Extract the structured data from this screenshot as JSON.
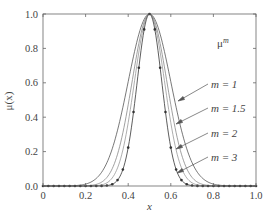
{
  "chart_data": {
    "type": "line",
    "title": "",
    "xlabel": "x",
    "ylabel": "μ(x)",
    "xlim": [
      0,
      1
    ],
    "ylim": [
      0,
      1
    ],
    "xticks": [
      "0",
      "0.2",
      "0.4",
      "0.6",
      "0.8",
      "1.0"
    ],
    "yticks": [
      "0.0",
      "0.2",
      "0.4",
      "0.6",
      "0.8",
      "1.0"
    ],
    "grid": false,
    "legend_title": "μ^m",
    "base_function": {
      "shape": "gaussian",
      "center": 0.5,
      "sigma": 0.1
    },
    "series": [
      {
        "name": "m = 1",
        "m": 1,
        "style": "solid",
        "color": "#555555",
        "x": [
          0.0,
          0.1,
          0.2,
          0.25,
          0.3,
          0.35,
          0.4,
          0.45,
          0.5,
          0.55,
          0.6,
          0.65,
          0.7,
          0.75,
          0.8,
          0.9,
          1.0
        ],
        "values": [
          0.0,
          0.0,
          0.01,
          0.04,
          0.14,
          0.32,
          0.61,
          0.88,
          1.0,
          0.88,
          0.61,
          0.32,
          0.14,
          0.04,
          0.01,
          0.0,
          0.0
        ]
      },
      {
        "name": "m = 1.5",
        "m": 1.5,
        "style": "solid",
        "color": "#888888",
        "x": [
          0.0,
          0.1,
          0.2,
          0.25,
          0.3,
          0.35,
          0.4,
          0.45,
          0.5,
          0.55,
          0.6,
          0.65,
          0.7,
          0.75,
          0.8,
          0.9,
          1.0
        ],
        "values": [
          0.0,
          0.0,
          0.0,
          0.01,
          0.05,
          0.18,
          0.47,
          0.83,
          1.0,
          0.83,
          0.47,
          0.18,
          0.05,
          0.01,
          0.0,
          0.0,
          0.0
        ]
      },
      {
        "name": "m = 2",
        "m": 2,
        "style": "solid",
        "color": "#999999",
        "x": [
          0.0,
          0.1,
          0.2,
          0.25,
          0.3,
          0.35,
          0.4,
          0.45,
          0.5,
          0.55,
          0.6,
          0.65,
          0.7,
          0.75,
          0.8,
          0.9,
          1.0
        ],
        "values": [
          0.0,
          0.0,
          0.0,
          0.0,
          0.02,
          0.11,
          0.37,
          0.78,
          1.0,
          0.78,
          0.37,
          0.11,
          0.02,
          0.0,
          0.0,
          0.0,
          0.0
        ]
      },
      {
        "name": "m = 3",
        "m": 3,
        "style": "solid-with-dot-markers",
        "color": "#333333",
        "x": [
          0.0,
          0.1,
          0.2,
          0.25,
          0.3,
          0.35,
          0.4,
          0.45,
          0.5,
          0.55,
          0.6,
          0.65,
          0.7,
          0.75,
          0.8,
          0.9,
          1.0
        ],
        "values": [
          0.0,
          0.0,
          0.0,
          0.0,
          0.0,
          0.03,
          0.22,
          0.69,
          1.0,
          0.69,
          0.22,
          0.03,
          0.0,
          0.0,
          0.0,
          0.0,
          0.0
        ]
      }
    ],
    "annotations": [
      {
        "text": "μ^m",
        "x": 0.8,
        "y": 0.86
      },
      {
        "text": "m = 1",
        "x": 0.82,
        "y": 0.62,
        "arrow_to": [
          0.645,
          0.39
        ]
      },
      {
        "text": "m = 1.5",
        "x": 0.82,
        "y": 0.48,
        "arrow_to": [
          0.635,
          0.25
        ]
      },
      {
        "text": "m = 2",
        "x": 0.82,
        "y": 0.34,
        "arrow_to": [
          0.64,
          0.16
        ]
      },
      {
        "text": "m = 3",
        "x": 0.82,
        "y": 0.21,
        "arrow_to": [
          0.62,
          0.08
        ]
      }
    ]
  },
  "labels": {
    "xlabel": "x",
    "ylabel": "μ(x)",
    "legend_title_base": "μ",
    "legend_title_sup": "m",
    "xticks": [
      "0",
      "0.2",
      "0.4",
      "0.6",
      "0.8",
      "1.0"
    ],
    "yticks": [
      "0.0",
      "0.2",
      "0.4",
      "0.6",
      "0.8",
      "1.0"
    ],
    "m1": "m = 1",
    "m15": "m = 1.5",
    "m2": "m = 2",
    "m3": "m = 3"
  }
}
